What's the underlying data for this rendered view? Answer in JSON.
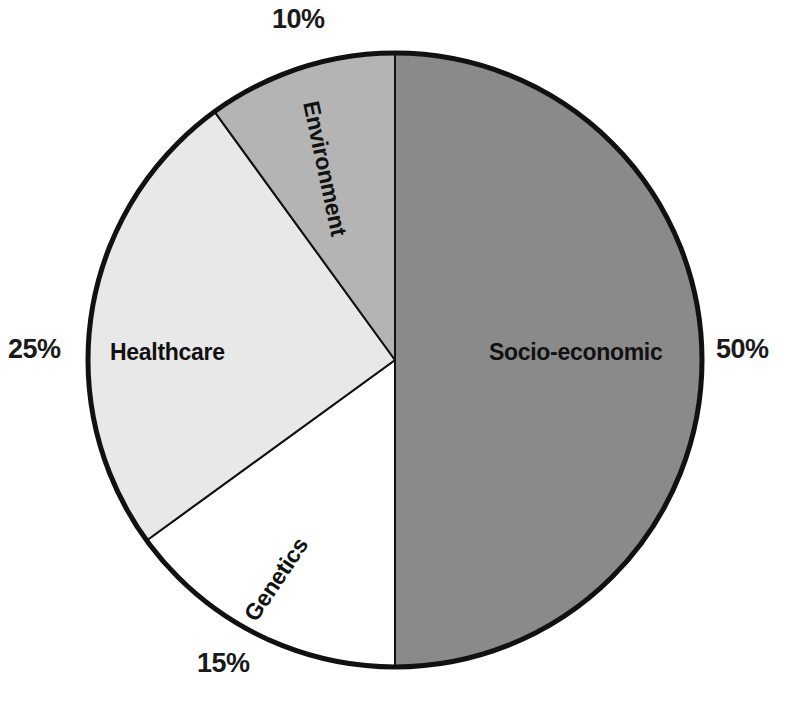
{
  "chart_data": {
    "type": "pie",
    "title": "",
    "subtitle": "",
    "xlabel": "",
    "ylabel": "",
    "legend_position": "none",
    "grid": false,
    "labels_inside_slices": true,
    "percent_labels_outside": true,
    "start_angle_deg": 0,
    "direction": "clockwise",
    "categories": [
      "Socio-economic",
      "Genetics",
      "Healthcare",
      "Environment"
    ],
    "values": [
      50,
      15,
      25,
      10
    ],
    "value_labels": [
      "50%",
      "15%",
      "25%",
      "10%"
    ],
    "units": "percent",
    "total": 100,
    "colors": [
      "#8a8a8a",
      "#ffffff",
      "#e8e8e8",
      "#b4b4b4"
    ],
    "slices": [
      {
        "name": "Socio-economic",
        "value": 50,
        "value_label": "50%",
        "color": "#8a8a8a",
        "start_angle_deg": 0,
        "end_angle_deg": 180,
        "label_rotation_deg": 0
      },
      {
        "name": "Genetics",
        "value": 15,
        "value_label": "15%",
        "color": "#ffffff",
        "start_angle_deg": 180,
        "end_angle_deg": 234,
        "label_rotation_deg": -56
      },
      {
        "name": "Healthcare",
        "value": 25,
        "value_label": "25%",
        "color": "#e8e8e8",
        "start_angle_deg": 234,
        "end_angle_deg": 324,
        "label_rotation_deg": 0
      },
      {
        "name": "Environment",
        "value": 10,
        "value_label": "10%",
        "color": "#b4b4b4",
        "start_angle_deg": 324,
        "end_angle_deg": 360,
        "label_rotation_deg": 78
      }
    ]
  },
  "style": {
    "background": "#ffffff",
    "outline_color": "#111111",
    "outline_width_px": 5,
    "divider_color": "#111111",
    "divider_width_px": 2,
    "text_color": "#111111",
    "percent_text_color": "#1a1a1a"
  },
  "geometry": {
    "center_x": 395,
    "center_y": 360,
    "radius": 307
  }
}
